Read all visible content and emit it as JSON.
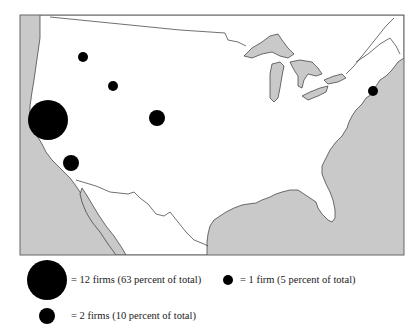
{
  "map": {
    "region": "Continental United States",
    "colors": {
      "ocean": "#c9c9c9",
      "land": "#ffffff",
      "lakes": "#c9c9c9",
      "border": "#333333",
      "marker": "#000000"
    },
    "markers": [
      {
        "label": "San Francisco Bay Area",
        "firms": 12,
        "cx": 48,
        "cy": 120,
        "r": 20
      },
      {
        "label": "Los Angeles area",
        "firms": 2,
        "cx": 71,
        "cy": 163,
        "r": 8
      },
      {
        "label": "Northwest interior",
        "firms": 1,
        "cx": 83,
        "cy": 57,
        "r": 5
      },
      {
        "label": "Idaho / Utah area",
        "firms": 1,
        "cx": 113,
        "cy": 86,
        "r": 5
      },
      {
        "label": "Colorado",
        "firms": 2,
        "cx": 157,
        "cy": 118,
        "r": 8
      },
      {
        "label": "New York / New England",
        "firms": 1,
        "cx": 373,
        "cy": 91,
        "r": 5
      }
    ]
  },
  "legend": {
    "large": {
      "text": "= 12 firms (63 percent of total)",
      "firms": 12,
      "percent": 63
    },
    "medium": {
      "text": "= 2 firms (10 percent of total)",
      "firms": 2,
      "percent": 10
    },
    "small": {
      "text": "= 1 firm (5 percent of total)",
      "firms": 1,
      "percent": 5
    }
  }
}
